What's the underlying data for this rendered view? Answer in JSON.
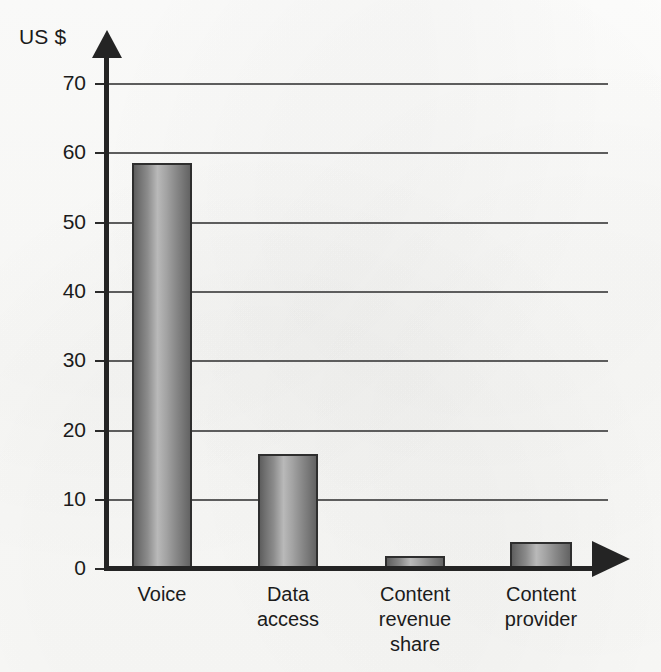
{
  "chart_data": {
    "type": "bar",
    "title": "",
    "subtitle": "",
    "xlabel": "",
    "ylabel": "US $",
    "categories": [
      "Voice",
      "Data access",
      "Content revenue share",
      "Content provider"
    ],
    "values": [
      58.5,
      16.4,
      1.8,
      3.8
    ],
    "ylim": [
      0,
      70
    ],
    "yticks": [
      0,
      10,
      20,
      30,
      40,
      50,
      60,
      70
    ],
    "ytick_labels": [
      "0",
      "10",
      "20",
      "30",
      "40",
      "50",
      "60",
      "70"
    ],
    "grid": true,
    "grid_axis": "y",
    "legend": false,
    "legend_position": "none",
    "series": [
      {
        "name": "US $",
        "values": [
          58.5,
          16.4,
          1.8,
          3.8
        ]
      }
    ],
    "bar_color": "#8b8b8b",
    "bar_outline_color": "#2e2e2e",
    "axis_color": "#242424",
    "grid_color": "#5d5d5d",
    "background_color": "#fdfdfb",
    "annotations": []
  },
  "axes": {
    "y_title": "US $",
    "y_arrow": "arrow-up",
    "x_arrow": "arrow-right"
  },
  "categories_display": [
    {
      "line1": "Voice",
      "line2": "",
      "line3": ""
    },
    {
      "line1": "Data",
      "line2": "access",
      "line3": ""
    },
    {
      "line1": "Content",
      "line2": "revenue",
      "line3": "share"
    },
    {
      "line1": "Content",
      "line2": "provider",
      "line3": ""
    }
  ]
}
